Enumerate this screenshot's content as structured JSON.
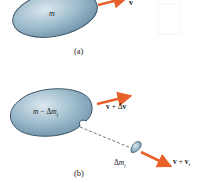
{
  "panel_a": {
    "body_label": "m",
    "velocity_label": "v",
    "caption": "(a)"
  },
  "panel_b": {
    "body_label_m": "m",
    "body_label_minus": " − Δ",
    "body_label_mf": "m",
    "body_label_sub": "f",
    "velocity_label_v": "v",
    "velocity_label_plus": " + Δ",
    "velocity_label_v2": "v",
    "fragment_label_delta": "Δ",
    "fragment_label_m": "m",
    "fragment_label_sub": "f",
    "fragment_velocity_v": "v",
    "fragment_velocity_plus": " + ",
    "fragment_velocity_v2": "v",
    "fragment_velocity_sub": "f",
    "caption": "(b)"
  },
  "colors": {
    "body_fill": "#8fb0c4",
    "body_stroke": "#3d5566",
    "arrow": "#e8602a"
  }
}
